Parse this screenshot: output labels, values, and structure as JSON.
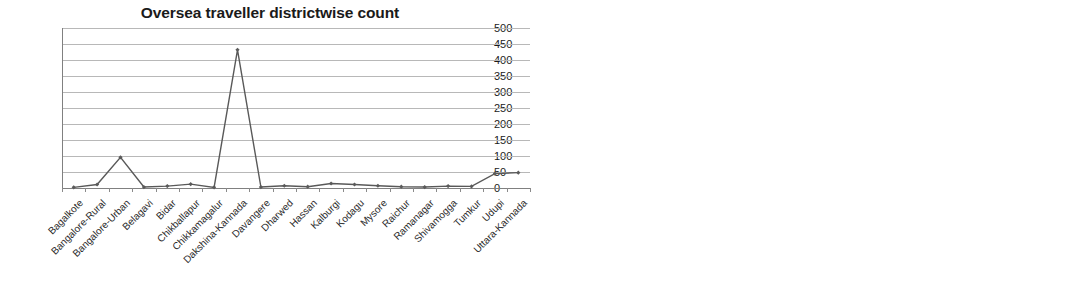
{
  "charts": [
    {
      "id": "overseas-travellers",
      "title": "Oversea traveller districtwise count",
      "chart_data": {
        "type": "line",
        "title": "Oversea traveller districtwise count",
        "xlabel": "",
        "ylabel": "",
        "ylim": [
          0,
          500
        ],
        "ytick_step": 50,
        "yticks": [
          0,
          50,
          100,
          150,
          200,
          250,
          300,
          350,
          400,
          450,
          500
        ],
        "grid": true,
        "legend": "none",
        "marker": "diamond",
        "categories": [
          "Bagalkote",
          "Bangalore-Rural",
          "Bangalore-Urban",
          "Belagavi",
          "Bidar",
          "Chikballapur",
          "Chikkamagalur",
          "Dakshina-Kannada",
          "Davangere",
          "Dharwed",
          "Hassan",
          "Kalburgi",
          "Kodagu",
          "Mysore",
          "Raichur",
          "Ramanagar",
          "Shivamogga",
          "Tumkur",
          "Udupi",
          "Uttara-Kannada"
        ],
        "values": [
          2,
          11,
          96,
          3,
          6,
          12,
          2,
          432,
          3,
          7,
          4,
          14,
          11,
          7,
          4,
          3,
          6,
          5,
          45,
          48
        ]
      }
    },
    {
      "id": "districtwise-count-right",
      "title": "",
      "chart_data": {
        "type": "line",
        "title": "",
        "xlabel": "",
        "ylabel": "",
        "ylim": [
          0,
          1400
        ],
        "ytick_step": 200,
        "yticks": [
          0,
          200,
          400,
          600,
          800,
          1000,
          1200,
          1400
        ],
        "grid": true,
        "legend": "none",
        "marker": "diamond",
        "categories": [
          "Bagalkote",
          "Bangalore-Rural",
          "Bangalore-Urban",
          "Belagavi",
          "Bellary",
          "Bidar",
          "Chamarajanagar",
          "Chikballapur",
          "Chikkamagalur",
          "Dakshina-Kannada",
          "Davangere",
          "Dharwed",
          "Gadag",
          "Hassan",
          "Haveri",
          "Kalburgi",
          "Kodagu",
          "Kolar",
          "Koppal",
          "Mandya",
          "Mysore",
          "Raichur",
          "Ramanagar",
          "Shivamogga",
          "Tumkur",
          "Udupi",
          "Uttara-Kannada",
          "Vijayapura",
          "Yadgir"
        ],
        "values": [
          95,
          20,
          90,
          185,
          60,
          375,
          10,
          135,
          25,
          150,
          20,
          50,
          40,
          270,
          20,
          1215,
          10,
          10,
          15,
          350,
          25,
          445,
          10,
          65,
          15,
          1095,
          155,
          160,
          925
        ]
      }
    }
  ]
}
